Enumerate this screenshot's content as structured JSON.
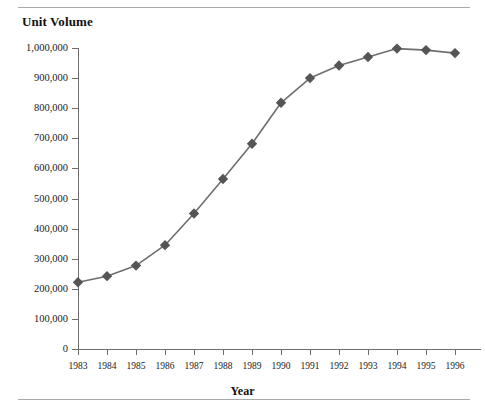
{
  "page": {
    "title": "Unit Volume",
    "rules": {
      "top_visible": true,
      "bottom_visible": true
    },
    "ghost_text": {
      "a": "··",
      "b": "···",
      "c": "·"
    }
  },
  "chart_data": {
    "type": "line",
    "title": "Unit Volume",
    "xlabel": "Year",
    "ylabel": "Unit Volume",
    "categories": [
      1983,
      1984,
      1985,
      1986,
      1987,
      1988,
      1989,
      1990,
      1991,
      1992,
      1993,
      1994,
      1995,
      1996
    ],
    "values": [
      222000,
      242000,
      277000,
      345000,
      450000,
      565000,
      682000,
      818000,
      900000,
      942000,
      970000,
      998000,
      993000,
      983000
    ],
    "ylim": [
      0,
      1000000
    ],
    "ytick_values": [
      0,
      100000,
      200000,
      300000,
      400000,
      500000,
      600000,
      700000,
      800000,
      900000,
      1000000
    ],
    "ytick_labels": [
      "0",
      "100,000",
      "200,000",
      "300,000",
      "400,000",
      "500,000",
      "600,000",
      "700,000",
      "800,000",
      "900,000",
      "1,000,000"
    ],
    "xtick_labels": [
      "1983",
      "1984",
      "1985",
      "1986",
      "1987",
      "1988",
      "1989",
      "1990",
      "1991",
      "1992",
      "1993",
      "1994",
      "1995",
      "1996"
    ],
    "grid": false,
    "legend": null,
    "marker": "diamond",
    "marker_color": "#555555",
    "line_color": "#6e6e6e",
    "axis_color": "#6e6e6e",
    "last_point_clipped": true
  }
}
